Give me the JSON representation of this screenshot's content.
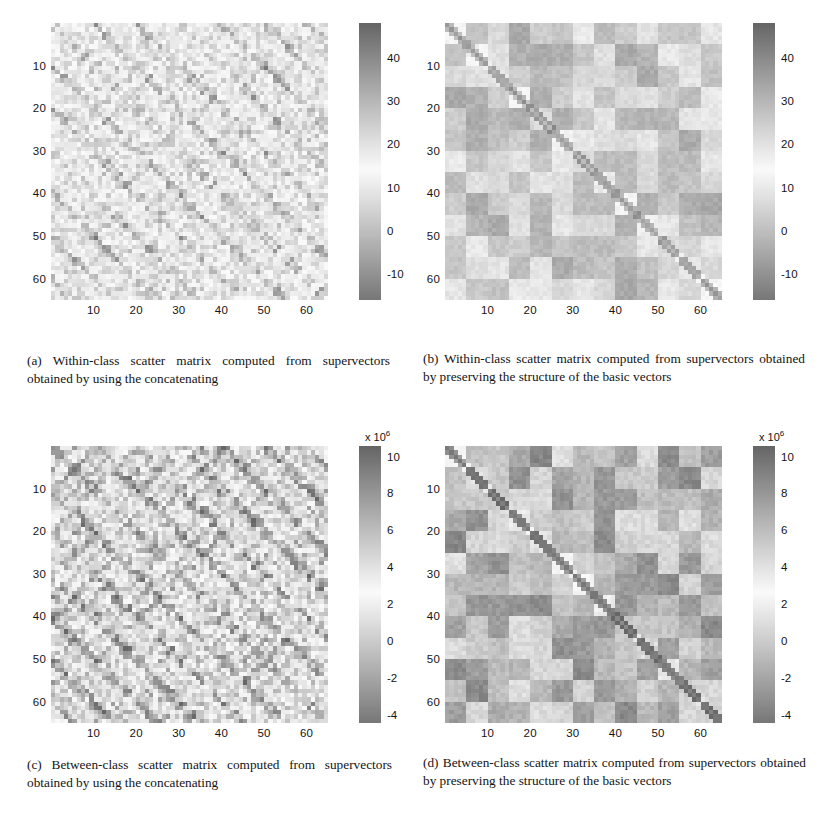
{
  "figure": {
    "type": "scientific-figure",
    "subfigure_count": 4,
    "layout": "2x2 grid of grayscale scatter-matrix heatmaps with colorbars"
  },
  "chart_data": [
    {
      "id": "a",
      "type": "heatmap",
      "title": "",
      "caption_label": "(a)",
      "caption_text": "Within-class scatter matrix computed from supervectors obtained by using the concatenating",
      "matrix_size": 65,
      "xlabel": "",
      "ylabel": "",
      "xticks": [
        10,
        20,
        30,
        40,
        50,
        60
      ],
      "yticks": [
        10,
        20,
        30,
        40,
        50,
        60
      ],
      "xlim": [
        1,
        65
      ],
      "ylim": [
        1,
        65
      ],
      "grid": false,
      "colormap": "inverted-gray",
      "colorbar": {
        "ticks": [
          -10,
          0,
          10,
          20,
          30,
          40
        ],
        "tick_labels": [
          "-10",
          "0",
          "10",
          "20",
          "30",
          "40"
        ],
        "vmin": -16,
        "vmax": 48,
        "exponent": "",
        "position": "right"
      },
      "pattern": "fine speckle with regular diagonal striping, period 5",
      "pattern_kind": "fine",
      "block_size": 5,
      "seed": 11,
      "base_level": 0.52,
      "noise": 0.34,
      "diag_strength": 0.28,
      "contrast": 0.85
    },
    {
      "id": "b",
      "type": "heatmap",
      "title": "",
      "caption_label": "(b)",
      "caption_text": "Within-class scatter matrix computed from supervectors obtained by preserving the structure of the basic vectors",
      "matrix_size": 65,
      "xlabel": "",
      "ylabel": "",
      "xticks": [
        10,
        20,
        30,
        40,
        50,
        60
      ],
      "yticks": [
        10,
        20,
        30,
        40,
        50,
        60
      ],
      "xlim": [
        1,
        65
      ],
      "ylim": [
        1,
        65
      ],
      "grid": false,
      "colormap": "inverted-gray",
      "colorbar": {
        "ticks": [
          -10,
          0,
          10,
          20,
          30,
          40
        ],
        "tick_labels": [
          "-10",
          "0",
          "10",
          "20",
          "30",
          "40"
        ],
        "vmin": -16,
        "vmax": 48,
        "exponent": "",
        "position": "right"
      },
      "pattern": "coarse 13x13 block checkerboard with dark main diagonal",
      "pattern_kind": "blocky",
      "block_size": 5,
      "seed": 23,
      "base_level": 0.5,
      "noise": 0.1,
      "diag_strength": 0.85,
      "contrast": 0.62
    },
    {
      "id": "c",
      "type": "heatmap",
      "title": "",
      "caption_label": "(c)",
      "caption_text": "Between-class scatter matrix computed from supervectors obtained by using the concatenating",
      "matrix_size": 65,
      "xlabel": "",
      "ylabel": "",
      "xticks": [
        10,
        20,
        30,
        40,
        50,
        60
      ],
      "yticks": [
        10,
        20,
        30,
        40,
        50,
        60
      ],
      "xlim": [
        1,
        65
      ],
      "ylim": [
        1,
        65
      ],
      "grid": false,
      "colormap": "inverted-gray",
      "colorbar": {
        "ticks": [
          -4,
          -2,
          0,
          2,
          4,
          6,
          8,
          10
        ],
        "tick_labels": [
          "-4",
          "-2",
          "0",
          "2",
          "4",
          "6",
          "8",
          "10"
        ],
        "vmin": -4,
        "vmax": 11,
        "exponent": "x 10",
        "exponent_power": "6",
        "position": "right"
      },
      "pattern": "fine high-frequency speckle, repeating period 5 texture",
      "pattern_kind": "fine",
      "block_size": 5,
      "seed": 37,
      "base_level": 0.6,
      "noise": 0.42,
      "diag_strength": 0.2,
      "contrast": 0.95
    },
    {
      "id": "d",
      "type": "heatmap",
      "title": "",
      "caption_label": "(d)",
      "caption_text": "Between-class scatter matrix computed from supervectors obtained by preserving the structure of the basic vectors",
      "matrix_size": 65,
      "xlabel": "",
      "ylabel": "",
      "xticks": [
        10,
        20,
        30,
        40,
        50,
        60
      ],
      "yticks": [
        10,
        20,
        30,
        40,
        50,
        60
      ],
      "xlim": [
        1,
        65
      ],
      "ylim": [
        1,
        65
      ],
      "grid": false,
      "colormap": "inverted-gray",
      "colorbar": {
        "ticks": [
          -4,
          -2,
          0,
          2,
          4,
          6,
          8,
          10
        ],
        "tick_labels": [
          "-4",
          "-2",
          "0",
          "2",
          "4",
          "6",
          "8",
          "10"
        ],
        "vmin": -4,
        "vmax": 11,
        "exponent": "x 10",
        "exponent_power": "6",
        "position": "right"
      },
      "pattern": "coarse 13x13 block checkerboard, high contrast, dark main diagonal",
      "pattern_kind": "blocky",
      "block_size": 5,
      "seed": 51,
      "base_level": 0.55,
      "noise": 0.09,
      "diag_strength": 0.95,
      "contrast": 0.9
    }
  ],
  "captions": {
    "a": {
      "label": "(a)",
      "text": "Within-class scatter matrix computed from supervectors obtained by using the concatenating"
    },
    "b": {
      "label": "(b)",
      "text": "Within-class scatter matrix computed from supervectors obtained by preserving the structure of the basic vectors"
    },
    "c": {
      "label": "(c)",
      "text": "Between-class scatter matrix computed from supervectors obtained by using the concatenating"
    },
    "d": {
      "label": "(d)",
      "text": "Between-class scatter matrix computed from supervectors obtained by preserving the structure of the basic vectors"
    }
  },
  "colors": {
    "background": "#ffffff",
    "text": "#141414",
    "axis": "#555555",
    "heat_dark": "#6f6f6f",
    "heat_light": "#f2f2f2"
  }
}
